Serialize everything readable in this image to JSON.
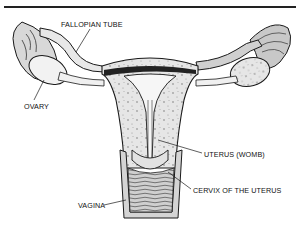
{
  "diagram": {
    "labels": [
      {
        "id": "fallopian_tube",
        "text": "FALLOPIAN TUBE",
        "x": 61,
        "y": 21
      },
      {
        "id": "ovary",
        "text": "OVARY",
        "x": 24,
        "y": 103
      },
      {
        "id": "uterus",
        "text": "UTERUS (WOMB)",
        "x": 204,
        "y": 151
      },
      {
        "id": "cervix",
        "text": "CERVIX OF THE UTERUS",
        "x": 193,
        "y": 187
      },
      {
        "id": "vagina",
        "text": "VAGINA",
        "x": 78,
        "y": 202
      }
    ],
    "colors": {
      "ink": "#1a1a1a",
      "tissue_fill": "#e4e4e4",
      "speckle": "#555555",
      "background": "#ffffff"
    }
  }
}
